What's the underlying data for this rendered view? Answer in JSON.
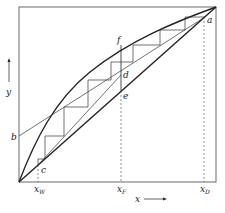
{
  "diagram": {
    "type": "McCabe-Thiele distillation diagram",
    "axes": {
      "x_label": "x",
      "y_label": "y"
    },
    "points": {
      "a": "a",
      "b": "b",
      "c": "c",
      "d": "d",
      "e": "e",
      "f": "f"
    },
    "x_ticks": {
      "xW": "x",
      "xW_sub": "W",
      "xF": "x",
      "xF_sub": "F",
      "xD": "x",
      "xD_sub": "D"
    },
    "colors": {
      "line": "#222222",
      "background": "#ffffff"
    }
  }
}
